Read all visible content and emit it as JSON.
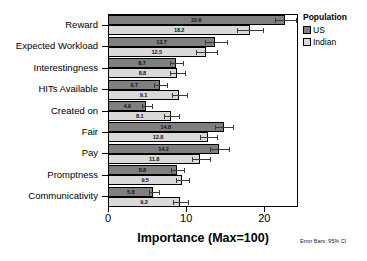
{
  "chart_data": {
    "type": "bar",
    "orientation": "horizontal",
    "title": "",
    "xlabel": "Importance (Max=100)",
    "ylabel": "",
    "xlim": [
      0,
      24.3
    ],
    "xticks": [
      0,
      10,
      20
    ],
    "xtick_labels": [
      "0",
      "10",
      "20"
    ],
    "grid": false,
    "legend_position": "right",
    "legend_title": "Population",
    "categories": [
      "Reward",
      "Expected Workload",
      "Interestingness",
      "HITs Available",
      "Created on",
      "Fair",
      "Pay",
      "Promptness",
      "Communicativity"
    ],
    "series": [
      {
        "name": "US",
        "color": "#7f7f7f",
        "values": [
          22.6,
          13.7,
          8.7,
          6.7,
          4.9,
          14.8,
          14.2,
          8.8,
          5.8
        ],
        "err_low": [
          21.3,
          12.4,
          7.9,
          5.9,
          4.3,
          13.7,
          13.0,
          8.0,
          5.2
        ],
        "err_high": [
          24.0,
          15.2,
          9.6,
          7.6,
          5.6,
          16.0,
          15.5,
          9.7,
          6.5
        ]
      },
      {
        "name": "Indian",
        "color": "#d9d9d9",
        "values": [
          18.2,
          12.5,
          8.8,
          9.1,
          8.1,
          12.8,
          11.8,
          9.5,
          9.2
        ],
        "err_low": [
          16.5,
          11.2,
          7.9,
          8.2,
          7.2,
          11.8,
          10.8,
          8.7,
          8.3
        ],
        "err_high": [
          19.8,
          13.9,
          9.8,
          10.1,
          9.1,
          13.9,
          13.0,
          10.4,
          10.2
        ]
      }
    ],
    "annotations": {
      "error_bars_note": "Error Bars: 95% CI"
    }
  },
  "legend": {
    "title": "Population",
    "items": [
      {
        "label": "US",
        "color": "#7f7f7f"
      },
      {
        "label": "Indian",
        "color": "#d9d9d9"
      }
    ]
  },
  "axis": {
    "x_title": "Importance (Max=100)",
    "x_ticks": [
      "0",
      "10",
      "20"
    ]
  },
  "footnote": "Error Bars: 95% CI"
}
